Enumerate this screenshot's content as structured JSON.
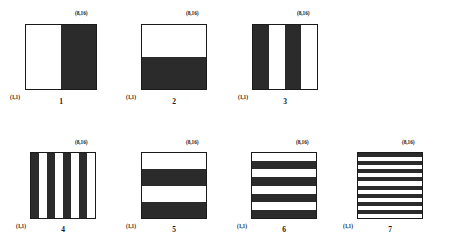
{
  "figure": {
    "background_color": "#ffffff",
    "ink_color": "#2b2b2b",
    "border_color": "#1a1a1a",
    "origin_label": "(1,1)",
    "extent_label": "(8,16)",
    "panels": [
      {
        "number": "1",
        "origin_label": "(1,1)",
        "extent_label": "(8,16)",
        "orientation": "vertical",
        "band_count": 2,
        "bands": [
          "light",
          "dark"
        ],
        "box": {
          "left": 25,
          "top": 24,
          "width": 72,
          "height": 66
        },
        "coord_top_right": {
          "left": 75,
          "top": 11
        },
        "coord_bottom_left": {
          "left": 10,
          "top": 95
        },
        "number_pos": {
          "left": 25,
          "top": 98,
          "width": 72
        }
      },
      {
        "number": "2",
        "origin_label": "(1,1)",
        "extent_label": "(8,16)",
        "orientation": "horizontal",
        "band_count": 2,
        "bands": [
          "light",
          "dark"
        ],
        "box": {
          "left": 141,
          "top": 24,
          "width": 66,
          "height": 66
        },
        "coord_top_right": {
          "left": 186,
          "top": 11
        },
        "coord_bottom_left": {
          "left": 126,
          "top": 95
        },
        "number_pos": {
          "left": 141,
          "top": 98,
          "width": 66
        }
      },
      {
        "number": "3",
        "origin_label": "(1,1)",
        "extent_label": "(8,16)",
        "orientation": "vertical",
        "band_count": 4,
        "bands": [
          "dark",
          "light",
          "dark",
          "light"
        ],
        "box": {
          "left": 252,
          "top": 24,
          "width": 66,
          "height": 66
        },
        "coord_top_right": {
          "left": 297,
          "top": 11
        },
        "coord_bottom_left": {
          "left": 238,
          "top": 95
        },
        "number_pos": {
          "left": 252,
          "top": 98,
          "width": 66
        }
      },
      {
        "number": "4",
        "origin_label": "(1,1)",
        "extent_label": "(8,16)",
        "orientation": "vertical",
        "band_count": 8,
        "bands": [
          "dark",
          "light",
          "dark",
          "light",
          "dark",
          "light",
          "dark",
          "light"
        ],
        "box": {
          "left": 30,
          "top": 152,
          "width": 66,
          "height": 67
        },
        "coord_top_right": {
          "left": 75,
          "top": 140
        },
        "coord_bottom_left": {
          "left": 16,
          "top": 224
        },
        "number_pos": {
          "left": 30,
          "top": 226,
          "width": 66
        }
      },
      {
        "number": "5",
        "origin_label": "(1,1)",
        "extent_label": "(8,16)",
        "orientation": "horizontal",
        "band_count": 4,
        "bands": [
          "light",
          "dark",
          "light",
          "dark"
        ],
        "box": {
          "left": 141,
          "top": 152,
          "width": 66,
          "height": 67
        },
        "coord_top_right": {
          "left": 186,
          "top": 140
        },
        "coord_bottom_left": {
          "left": 126,
          "top": 224
        },
        "number_pos": {
          "left": 141,
          "top": 226,
          "width": 66
        }
      },
      {
        "number": "6",
        "origin_label": "(1,1)",
        "extent_label": "(8,16)",
        "orientation": "horizontal",
        "band_count": 8,
        "bands": [
          "light",
          "dark",
          "light",
          "dark",
          "light",
          "dark",
          "light",
          "dark"
        ],
        "box": {
          "left": 251,
          "top": 152,
          "width": 66,
          "height": 67
        },
        "coord_top_right": {
          "left": 296,
          "top": 140
        },
        "coord_bottom_left": {
          "left": 237,
          "top": 224
        },
        "number_pos": {
          "left": 251,
          "top": 226,
          "width": 66
        }
      },
      {
        "number": "7",
        "origin_label": "(1,1)",
        "extent_label": "(8,16)",
        "orientation": "horizontal",
        "band_count": 16,
        "bands": [
          "dark",
          "light",
          "dark",
          "light",
          "dark",
          "light",
          "dark",
          "light",
          "dark",
          "light",
          "dark",
          "light",
          "dark",
          "light",
          "dark",
          "light"
        ],
        "box": {
          "left": 357,
          "top": 152,
          "width": 66,
          "height": 67
        },
        "coord_top_right": {
          "left": 402,
          "top": 140
        },
        "coord_bottom_left": {
          "left": 343,
          "top": 224
        },
        "number_pos": {
          "left": 357,
          "top": 226,
          "width": 66
        }
      }
    ]
  }
}
